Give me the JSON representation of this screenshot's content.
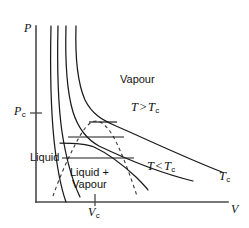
{
  "figure": {
    "kind": "pressure-volume-phase-diagram",
    "width": 249,
    "height": 228,
    "background_color": "#ffffff",
    "curve_color": "#1a1a1a",
    "axis_color": "#4a4a4a",
    "dome_color": "#3a3a3a"
  },
  "axes": {
    "y_axis_label": "P",
    "x_axis_label": "V",
    "y_tick_label_main": "P",
    "y_tick_label_sub": "c",
    "x_tick_label_main": "V",
    "x_tick_label_sub": "c",
    "origin_x": 36,
    "origin_y": 202,
    "x_axis_end": 228,
    "y_axis_top": 26,
    "pc_y": 113,
    "vc_x": 95
  },
  "labels": {
    "vapour": "Vapour",
    "liquid": "Liquid",
    "liquid_plus": "Liquid +",
    "liquid_vapour_second": "Vapour",
    "t_above_main": "T",
    "t_above_op": ">",
    "t_above_crit": "T",
    "t_above_sub": "c",
    "t_below_main": "T",
    "t_below_op": "<",
    "t_below_crit": "T",
    "t_below_sub": "c",
    "tc_curve_main": "T",
    "tc_curve_sub": "c"
  },
  "chart_data": {
    "type": "line",
    "xlabel": "V",
    "ylabel": "P",
    "grid": false,
    "legend": "inline-annotations",
    "annotations": [
      {
        "text": "Vapour",
        "x": 120,
        "y": 80,
        "region": "vapour-region"
      },
      {
        "text": "Liquid",
        "x": 31,
        "y": 152,
        "region": "liquid-region"
      },
      {
        "text": "Liquid + Vapour",
        "x": 70,
        "y": 168,
        "region": "two-phase-region"
      },
      {
        "text": "T > Tc",
        "x": 131,
        "y": 104,
        "region": "supercritical-isotherms"
      },
      {
        "text": "T < Tc",
        "x": 147,
        "y": 162,
        "region": "subcritical-isotherms"
      },
      {
        "text": "Tc",
        "x": 219,
        "y": 172,
        "region": "critical-isotherm-end"
      }
    ],
    "critical_point": {
      "V": 95,
      "P": 113,
      "label": "critical point"
    },
    "series": [
      {
        "name": "isotherm-1-highest-T",
        "kind": "supercritical",
        "path": "M 51,26 C 50,70 51,110 54,140 C 57,168 61,188 66,202"
      },
      {
        "name": "isotherm-2",
        "kind": "supercritical",
        "path": "M 58,26 C 57,68 58,104 62,132 C 66,158 72,180 80,197"
      },
      {
        "name": "isotherm-3-critical",
        "kind": "critical",
        "path": "M 66,26 C 65,62 67,92 73,112 C 79,131 88,140 99,146 C 122,157 160,173 193,181"
      },
      {
        "name": "isotherm-4-subcritical-upper",
        "kind": "subcritical",
        "path": "M 76,26 C 75,58 78,84 85,100 C 92,114 102,120 116,126 C 146,139 186,158 222,172"
      },
      {
        "name": "isotherm-5-subcritical-lower",
        "kind": "subcritical",
        "path": "M 60,143 C 72,143 85,143 94,147 C 107,153 123,165 136,177 C 142,183 146,187 148,190"
      }
    ],
    "tie_lines": [
      {
        "name": "tie-line-critical",
        "y": 122,
        "x1": 89,
        "x2": 117
      },
      {
        "name": "tie-line-middle",
        "y": 137,
        "x1": 68,
        "x2": 124
      },
      {
        "name": "tie-line-lower",
        "y": 158,
        "x1": 62,
        "x2": 134
      }
    ],
    "coexistence_dome": {
      "name": "coexistence-curve",
      "style": "dashed",
      "path": "M 53,196 C 60,176 72,148 83,131 C 88,124 92,121 96,121 C 101,121 107,126 113,136 C 122,152 131,178 137,196"
    }
  }
}
